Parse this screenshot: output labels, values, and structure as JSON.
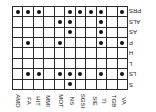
{
  "figure": {
    "type": "presence-matrix",
    "orientation": "rotated-180",
    "background_color": "#ffffff",
    "grid_line_color": "#2b2b2b",
    "marker_color": "#111111",
    "marker_shape": "filled-circle"
  },
  "chart_data": {
    "type": "heatmap",
    "title": "",
    "xlabel": "",
    "ylabel": "",
    "columns": [
      "VA",
      "TGB",
      "TI",
      "SIE",
      "SGSI",
      "NS",
      "MOT",
      "MMI",
      "HIT",
      "FA",
      "AMD"
    ],
    "rows": [
      "S",
      "LS",
      "L",
      "H",
      "P",
      "AS",
      "ALS",
      "PRS"
    ],
    "values": [
      [
        0,
        0,
        0,
        0,
        0,
        1,
        0,
        0,
        0,
        0,
        0
      ],
      [
        1,
        0,
        1,
        0,
        1,
        1,
        1,
        0,
        1,
        1,
        0
      ],
      [
        0,
        0,
        0,
        0,
        0,
        0,
        0,
        0,
        0,
        0,
        0
      ],
      [
        0,
        0,
        0,
        0,
        0,
        0,
        0,
        0,
        0,
        0,
        0
      ],
      [
        1,
        0,
        1,
        0,
        0,
        0,
        1,
        0,
        0,
        1,
        0
      ],
      [
        0,
        0,
        1,
        0,
        0,
        1,
        0,
        0,
        0,
        0,
        0
      ],
      [
        0,
        0,
        1,
        0,
        0,
        1,
        1,
        0,
        0,
        0,
        0
      ],
      [
        1,
        0,
        1,
        1,
        1,
        1,
        0,
        0,
        1,
        1,
        1
      ]
    ],
    "legend": [],
    "grid": true
  }
}
